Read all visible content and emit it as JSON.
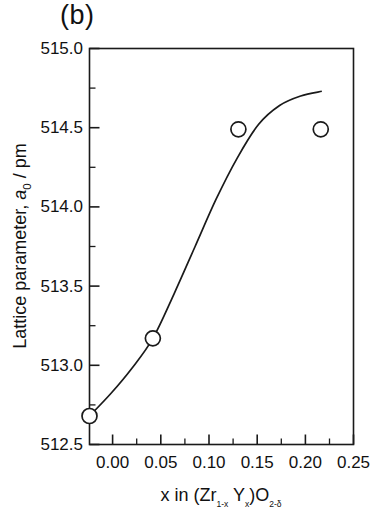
{
  "panel": {
    "label": "(b)"
  },
  "chart_data": {
    "type": "scatter",
    "title": "(b)",
    "xlabel": "x in (Zr1-xYx)O2-δ",
    "xlabel_parts": {
      "lead": "x in (Zr",
      "sub1": "1-x",
      "mid": "Y",
      "sub2": "x",
      "close": ")O",
      "sub3": "2-δ"
    },
    "ylabel": "Lattice parameter, a0 / pm",
    "ylabel_parts": {
      "lead": "Lattice parameter, ",
      "italic": "a",
      "sub": "0",
      "tail": " / pm"
    },
    "xlim": [
      0.0,
      0.25
    ],
    "ylim": [
      512.5,
      515.0
    ],
    "xticks": [
      0.0,
      0.05,
      0.1,
      0.15,
      0.2,
      0.25
    ],
    "xtick_labels": [
      "0.00",
      "0.05",
      "0.10",
      "0.15",
      "0.20",
      "0.25"
    ],
    "yticks": [
      512.5,
      513.0,
      513.5,
      514.0,
      514.5,
      515.0
    ],
    "ytick_labels": [
      "512.5",
      "513.0",
      "513.5",
      "514.0",
      "514.5",
      "515.0"
    ],
    "x_minor_step": 0.025,
    "y_minor_step": 0.25,
    "grid": false,
    "legend": null,
    "marker": "open-circle",
    "marker_color": "#1a1a1a",
    "line_color": "#1a1a1a",
    "series": [
      {
        "name": "Lattice parameter data",
        "x": [
          0.0,
          0.06,
          0.141,
          0.219
        ],
        "y": [
          512.68,
          513.17,
          514.49,
          514.49
        ]
      }
    ],
    "fit_curve": {
      "name": "guide to the eye",
      "x": [
        0.0,
        0.02,
        0.04,
        0.06,
        0.08,
        0.1,
        0.12,
        0.14,
        0.16,
        0.18,
        0.2,
        0.22
      ],
      "y": [
        512.68,
        512.82,
        512.98,
        513.17,
        513.45,
        513.75,
        514.05,
        514.31,
        514.52,
        514.64,
        514.7,
        514.73
      ]
    }
  }
}
